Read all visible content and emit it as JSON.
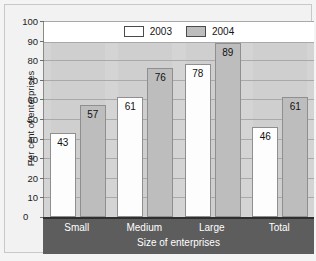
{
  "chart_data": {
    "type": "bar",
    "title": "",
    "xlabel": "Size of enterprises",
    "ylabel": "Per cent of enterprises",
    "categories": [
      "Small",
      "Medium",
      "Large",
      "Total"
    ],
    "series": [
      {
        "name": "2003",
        "color": "#fdfdfd",
        "values": [
          43,
          61,
          78,
          46
        ]
      },
      {
        "name": "2004",
        "color": "#bdbdbd",
        "values": [
          57,
          76,
          89,
          61
        ]
      }
    ],
    "ylim": [
      0,
      100
    ],
    "yticks": [
      0,
      10,
      20,
      30,
      40,
      50,
      60,
      70,
      80,
      90,
      100
    ],
    "ytick_labels": [
      "0",
      "10",
      "20",
      "30",
      "40",
      "50",
      "60",
      "70",
      "80",
      "90",
      "100"
    ],
    "grid": true,
    "legend_position": "top-center",
    "data_labels": true
  },
  "legend": {
    "items": [
      {
        "label": "2003",
        "swatch": "white"
      },
      {
        "label": "2004",
        "swatch": "gray"
      }
    ]
  },
  "axis": {
    "zero_label": "0"
  }
}
